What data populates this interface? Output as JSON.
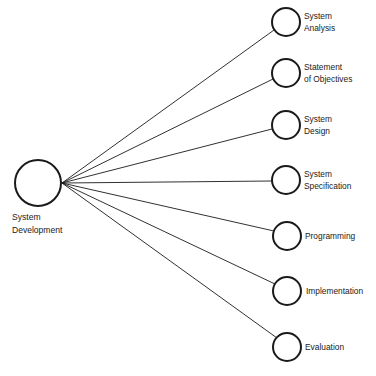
{
  "diagram": {
    "type": "hub-and-spoke",
    "colors": {
      "stroke": "#1a1a1a",
      "background": "#ffffff",
      "text": "#1a1a1a"
    },
    "hub": {
      "label_line1": "System",
      "label_line2": "Development",
      "cx": 38,
      "cy": 183,
      "r": 23
    },
    "nodes": [
      {
        "label_line1": "System",
        "label_line2": "Analysis",
        "cx": 286,
        "cy": 22
      },
      {
        "label_line1": "Statement",
        "label_line2": "of Objectives",
        "cx": 286,
        "cy": 73
      },
      {
        "label_line1": "System",
        "label_line2": "Design",
        "cx": 286,
        "cy": 125
      },
      {
        "label_line1": "System",
        "label_line2": "Specification",
        "cx": 286,
        "cy": 180
      },
      {
        "label_line1": "Programming",
        "label_line2": "",
        "cx": 287,
        "cy": 236
      },
      {
        "label_line1": "Implementation",
        "label_line2": "",
        "cx": 287,
        "cy": 291
      },
      {
        "label_line1": "Evaluation",
        "label_line2": "",
        "cx": 287,
        "cy": 347
      }
    ],
    "node_radius": 14,
    "caption": ""
  }
}
